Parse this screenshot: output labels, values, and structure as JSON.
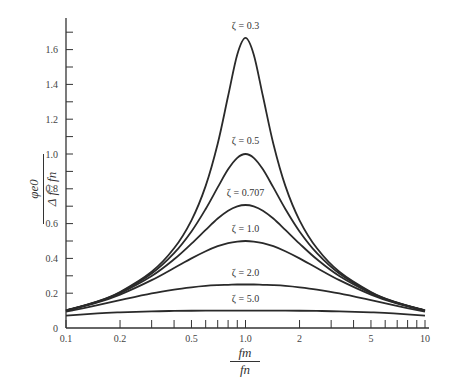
{
  "chart_data": {
    "type": "line",
    "title": "",
    "xlabel": "fm / fn",
    "ylabel": "φe0 / (Δf / fn)",
    "xscale": "log",
    "xlim": [
      0.1,
      10
    ],
    "ylim": [
      0,
      1.75
    ],
    "x_ticks": [
      "0.1",
      "0.2",
      "0.5",
      "1.0",
      "2",
      "5",
      "10"
    ],
    "y_ticks": [
      "0",
      "0.2",
      "0.4",
      "0.6",
      "0.8",
      "1.0",
      "1.2",
      "1.4",
      "1.6"
    ],
    "grid": false,
    "x": [
      0.1,
      0.15,
      0.2,
      0.3,
      0.4,
      0.5,
      0.6,
      0.7,
      0.8,
      0.9,
      1.0,
      1.111,
      1.25,
      1.429,
      1.667,
      2.0,
      2.5,
      3.333,
      5.0,
      6.667,
      10.0
    ],
    "series": [
      {
        "name": "ζ = 0.3",
        "values": [
          0.101,
          0.153,
          0.207,
          0.323,
          0.458,
          0.619,
          0.817,
          1.059,
          1.333,
          1.572,
          1.667,
          1.572,
          1.333,
          1.059,
          0.817,
          0.619,
          0.458,
          0.323,
          0.207,
          0.153,
          0.101
        ]
      },
      {
        "name": "ζ = 0.5",
        "values": [
          0.1005,
          0.152,
          0.204,
          0.313,
          0.43,
          0.555,
          0.684,
          0.808,
          0.912,
          0.978,
          1.0,
          0.978,
          0.912,
          0.808,
          0.684,
          0.555,
          0.43,
          0.313,
          0.204,
          0.152,
          0.1005
        ]
      },
      {
        "name": "ζ = 0.707",
        "values": [
          0.1,
          0.15,
          0.2,
          0.299,
          0.395,
          0.485,
          0.564,
          0.629,
          0.674,
          0.699,
          0.707,
          0.699,
          0.674,
          0.629,
          0.564,
          0.485,
          0.395,
          0.299,
          0.2,
          0.15,
          0.1
        ]
      },
      {
        "name": "ζ = 1.0",
        "values": [
          0.099,
          0.147,
          0.192,
          0.275,
          0.345,
          0.4,
          0.441,
          0.47,
          0.488,
          0.497,
          0.5,
          0.497,
          0.488,
          0.47,
          0.441,
          0.4,
          0.345,
          0.275,
          0.192,
          0.147,
          0.099
        ]
      },
      {
        "name": "ζ = 2.0",
        "values": [
          0.094,
          0.131,
          0.16,
          0.199,
          0.221,
          0.234,
          0.242,
          0.246,
          0.248,
          0.25,
          0.25,
          0.25,
          0.248,
          0.246,
          0.242,
          0.234,
          0.221,
          0.199,
          0.16,
          0.131,
          0.094
        ]
      },
      {
        "name": "ζ = 5.0",
        "values": [
          0.071,
          0.084,
          0.09,
          0.096,
          0.098,
          0.099,
          0.0994,
          0.0997,
          0.0999,
          0.1,
          0.1,
          0.1,
          0.0999,
          0.0997,
          0.0994,
          0.099,
          0.098,
          0.096,
          0.09,
          0.084,
          0.071
        ]
      }
    ],
    "annotations": [
      {
        "text": "ζ = 0.3",
        "x": 1.0,
        "y": 1.72
      },
      {
        "text": "ζ = 0.5",
        "x": 1.0,
        "y": 1.06
      },
      {
        "text": "ζ = 0.707",
        "x": 1.0,
        "y": 0.76
      },
      {
        "text": "ζ = 1.0",
        "x": 1.0,
        "y": 0.55
      },
      {
        "text": "ζ = 2.0",
        "x": 1.0,
        "y": 0.3
      },
      {
        "text": "ζ = 5.0",
        "x": 1.0,
        "y": 0.15
      }
    ]
  },
  "axis_labels": {
    "y_num": "φe0",
    "y_den": "Δ f / fn",
    "x_num": "fm",
    "x_den": "fn"
  }
}
